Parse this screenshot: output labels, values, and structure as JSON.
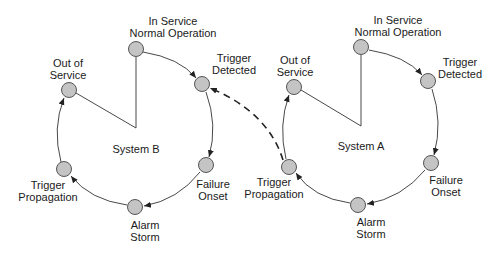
{
  "diagram": {
    "type": "state-cycle",
    "systems": [
      {
        "name": "System B",
        "label": "System B",
        "states": [
          {
            "id": "in-service",
            "lines": [
              "In Service",
              "Normal Operation"
            ]
          },
          {
            "id": "trigger-detected",
            "lines": [
              "Trigger",
              "Detected"
            ]
          },
          {
            "id": "failure-onset",
            "lines": [
              "Failure",
              "Onset"
            ]
          },
          {
            "id": "alarm-storm",
            "lines": [
              "Alarm",
              "Storm"
            ]
          },
          {
            "id": "trigger-propagation",
            "lines": [
              "Trigger",
              "Propagation"
            ]
          },
          {
            "id": "out-of-service",
            "lines": [
              "Out of",
              "Service"
            ]
          }
        ]
      },
      {
        "name": "System A",
        "label": "System A",
        "states": [
          {
            "id": "in-service",
            "lines": [
              "In Service",
              "Normal Operation"
            ]
          },
          {
            "id": "trigger-detected",
            "lines": [
              "Trigger",
              "Detected"
            ]
          },
          {
            "id": "failure-onset",
            "lines": [
              "Failure",
              "Onset"
            ]
          },
          {
            "id": "alarm-storm",
            "lines": [
              "Alarm",
              "Storm"
            ]
          },
          {
            "id": "trigger-propagation",
            "lines": [
              "Trigger",
              "Propagation"
            ]
          },
          {
            "id": "out-of-service",
            "lines": [
              "Out of",
              "Service"
            ]
          }
        ]
      }
    ],
    "cross_link": {
      "from": "System A.trigger-propagation",
      "to": "System B.trigger-detected",
      "style": "dashed"
    },
    "colors": {
      "node_fill": "#c4c4c4",
      "node_stroke": "#555555",
      "edge": "#333333",
      "text": "#1a1a1a"
    }
  }
}
